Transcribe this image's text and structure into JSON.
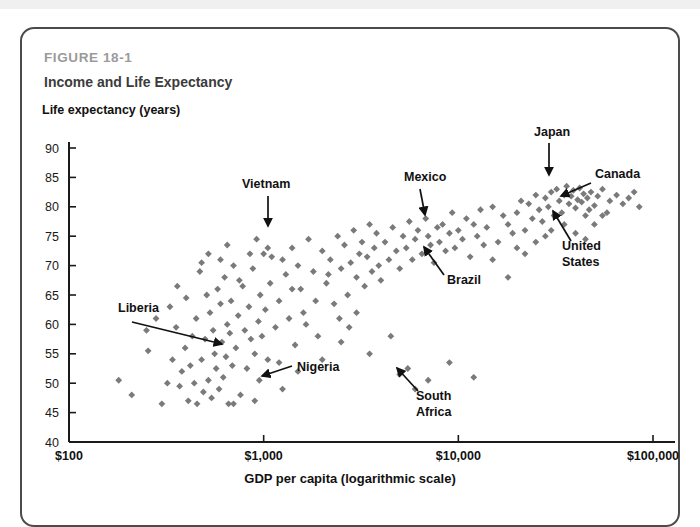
{
  "figure": {
    "number": "FIGURE 18-1",
    "title": "Income and Life Expectancy"
  },
  "axis_titles": {
    "y": "Life expectancy (years)",
    "x": "GDP per capita (logarithmic scale)"
  },
  "colors": {
    "marker": "#7a7a7a",
    "axis": "#1a1a1a",
    "figure_number": "#9a9a9a",
    "title": "#3b3b3b",
    "card_border": "#4b4b4b",
    "background": "#ffffff"
  },
  "chart_data": {
    "type": "scatter",
    "title": "Income and Life Expectancy",
    "subtitle": "FIGURE 18-1",
    "xlabel": "GDP per capita (logarithmic scale)",
    "ylabel": "Life expectancy (years)",
    "xscale": "log",
    "yscale": "linear",
    "xlim": [
      100,
      100000
    ],
    "ylim": [
      40,
      90
    ],
    "grid": false,
    "legend": null,
    "xticks": [
      100,
      1000,
      10000,
      100000
    ],
    "xticklabels": [
      "$100",
      "$1,000",
      "$10,000",
      "$100,000"
    ],
    "yticks": [
      40,
      45,
      50,
      55,
      60,
      65,
      70,
      75,
      80,
      85,
      90
    ],
    "yticklabels": [
      "40",
      "45",
      "50",
      "55",
      "60",
      "65",
      "70",
      "75",
      "80",
      "85",
      "90"
    ],
    "marker": "diamond",
    "marker_color": "#7a7a7a",
    "annotations": [
      {
        "label": "Liberia",
        "label_x": 118,
        "label_y": 312,
        "tip_x": 222,
        "tip_y": 344,
        "tail_x": 132,
        "tail_y": 322,
        "align": "start"
      },
      {
        "label": "Vietnam",
        "label_x": 242,
        "label_y": 188,
        "tip_x": 268,
        "tip_y": 226,
        "tail_x": 268,
        "tail_y": 196,
        "align": "start"
      },
      {
        "label": "Nigeria",
        "label_x": 297,
        "label_y": 371,
        "tip_x": 262,
        "tip_y": 376,
        "tail_x": 292,
        "tail_y": 366,
        "align": "start"
      },
      {
        "label": "Mexico",
        "label_x": 404,
        "label_y": 181,
        "tip_x": 425,
        "tip_y": 215,
        "tail_x": 420,
        "tail_y": 189,
        "align": "start"
      },
      {
        "label": "Brazil",
        "label_x": 447,
        "label_y": 284,
        "tip_x": 424,
        "tip_y": 247,
        "tail_x": 444,
        "tail_y": 275,
        "align": "start"
      },
      {
        "label": "Japan",
        "label_x": 534,
        "label_y": 136,
        "tip_x": 549,
        "tip_y": 175,
        "tail_x": 549,
        "tail_y": 143,
        "align": "start"
      },
      {
        "label": "Canada",
        "label_x": 595,
        "label_y": 178,
        "tip_x": 561,
        "tip_y": 196,
        "tail_x": 591,
        "tail_y": 183,
        "align": "start"
      },
      {
        "label": "United",
        "label_x": 562,
        "label_y": 250,
        "tip_x": 553,
        "tip_y": 211,
        "tail_x": 571,
        "tail_y": 241,
        "align": "start"
      },
      {
        "label": "States",
        "label_x": 562,
        "label_y": 266,
        "tip_x": null,
        "tip_y": null,
        "tail_x": null,
        "tail_y": null,
        "align": "start"
      },
      {
        "label": "South",
        "label_x": 416,
        "label_y": 400,
        "tip_x": 397,
        "tip_y": 368,
        "tail_x": 418,
        "tail_y": 391,
        "align": "start"
      },
      {
        "label": "Africa",
        "label_x": 416,
        "label_y": 416,
        "tip_x": null,
        "tip_y": null,
        "tail_x": null,
        "tail_y": null,
        "align": "start"
      }
    ],
    "points": [
      [
        180,
        50.5
      ],
      [
        210,
        48
      ],
      [
        255,
        55.5
      ],
      [
        300,
        46.5
      ],
      [
        330,
        63
      ],
      [
        355,
        59.5
      ],
      [
        360,
        66.5
      ],
      [
        370,
        49.5
      ],
      [
        380,
        52
      ],
      [
        395,
        56
      ],
      [
        400,
        64.5
      ],
      [
        410,
        47
      ],
      [
        420,
        53
      ],
      [
        430,
        58
      ],
      [
        440,
        50
      ],
      [
        450,
        61
      ],
      [
        455,
        46.5
      ],
      [
        470,
        69
      ],
      [
        480,
        54
      ],
      [
        490,
        48.5
      ],
      [
        500,
        57.5
      ],
      [
        510,
        65
      ],
      [
        520,
        50.5
      ],
      [
        530,
        62
      ],
      [
        540,
        47.5
      ],
      [
        550,
        59
      ],
      [
        560,
        55
      ],
      [
        570,
        52.5
      ],
      [
        580,
        66
      ],
      [
        590,
        49
      ],
      [
        600,
        63.5
      ],
      [
        610,
        57
      ],
      [
        620,
        51
      ],
      [
        630,
        68
      ],
      [
        640,
        54.5
      ],
      [
        650,
        60
      ],
      [
        660,
        46.5
      ],
      [
        670,
        58.5
      ],
      [
        680,
        64
      ],
      [
        690,
        53
      ],
      [
        700,
        70
      ],
      [
        720,
        56
      ],
      [
        740,
        61.5
      ],
      [
        760,
        48
      ],
      [
        780,
        66.5
      ],
      [
        800,
        59
      ],
      [
        820,
        52.5
      ],
      [
        840,
        63
      ],
      [
        860,
        57.5
      ],
      [
        880,
        69.5
      ],
      [
        900,
        55
      ],
      [
        920,
        74.5
      ],
      [
        940,
        60.5
      ],
      [
        950,
        50.5
      ],
      [
        960,
        65
      ],
      [
        980,
        58
      ],
      [
        1000,
        72
      ],
      [
        1020,
        62.5
      ],
      [
        1050,
        54
      ],
      [
        1080,
        67
      ],
      [
        1100,
        71.5
      ],
      [
        1150,
        59.5
      ],
      [
        1200,
        64
      ],
      [
        1250,
        49
      ],
      [
        1300,
        68.5
      ],
      [
        1350,
        61
      ],
      [
        1400,
        73
      ],
      [
        1450,
        56.5
      ],
      [
        1500,
        70
      ],
      [
        1550,
        66
      ],
      [
        1600,
        62
      ],
      [
        1700,
        74.5
      ],
      [
        1800,
        69
      ],
      [
        1900,
        58
      ],
      [
        2000,
        72.5
      ],
      [
        2100,
        67
      ],
      [
        2200,
        71
      ],
      [
        2300,
        63.5
      ],
      [
        2400,
        75
      ],
      [
        2500,
        69.5
      ],
      [
        2600,
        73.5
      ],
      [
        2700,
        65
      ],
      [
        2800,
        70.5
      ],
      [
        2900,
        76
      ],
      [
        3000,
        68
      ],
      [
        3100,
        72
      ],
      [
        3200,
        74
      ],
      [
        3300,
        66.5
      ],
      [
        3400,
        71.5
      ],
      [
        3500,
        77
      ],
      [
        3600,
        69
      ],
      [
        3700,
        73
      ],
      [
        3800,
        75.5
      ],
      [
        3900,
        70
      ],
      [
        4000,
        67.5
      ],
      [
        4200,
        74
      ],
      [
        4400,
        71
      ],
      [
        4600,
        76.5
      ],
      [
        4800,
        72.5
      ],
      [
        5000,
        69.5
      ],
      [
        5200,
        75
      ],
      [
        5400,
        73
      ],
      [
        5600,
        77.5
      ],
      [
        5800,
        71
      ],
      [
        6000,
        74.5
      ],
      [
        6200,
        76
      ],
      [
        6500,
        72
      ],
      [
        6800,
        78
      ],
      [
        7000,
        75
      ],
      [
        7200,
        73.5
      ],
      [
        7500,
        70.5
      ],
      [
        7800,
        76.5
      ],
      [
        8000,
        74
      ],
      [
        8300,
        77
      ],
      [
        8600,
        72.5
      ],
      [
        9000,
        75.5
      ],
      [
        9300,
        79
      ],
      [
        9600,
        73
      ],
      [
        10000,
        76
      ],
      [
        10500,
        74.5
      ],
      [
        11000,
        78
      ],
      [
        11500,
        71.5
      ],
      [
        12000,
        77
      ],
      [
        12500,
        75
      ],
      [
        13000,
        79.5
      ],
      [
        13500,
        73.5
      ],
      [
        14000,
        76.5
      ],
      [
        15000,
        80
      ],
      [
        16000,
        74
      ],
      [
        17000,
        78.5
      ],
      [
        18000,
        77
      ],
      [
        19000,
        75.5
      ],
      [
        20000,
        79
      ],
      [
        21000,
        81
      ],
      [
        22000,
        76
      ],
      [
        23000,
        80.5
      ],
      [
        24000,
        78
      ],
      [
        25000,
        82
      ],
      [
        26000,
        79.5
      ],
      [
        27000,
        77.5
      ],
      [
        28000,
        81.5
      ],
      [
        29000,
        80
      ],
      [
        30000,
        82.5
      ],
      [
        31000,
        78.5
      ],
      [
        32000,
        83
      ],
      [
        33000,
        81
      ],
      [
        34000,
        79
      ],
      [
        35000,
        82
      ],
      [
        36000,
        83.5
      ],
      [
        37000,
        80.5
      ],
      [
        38000,
        81.8
      ],
      [
        39000,
        82.8
      ],
      [
        40000,
        79.8
      ],
      [
        41000,
        81.2
      ],
      [
        42000,
        83.2
      ],
      [
        43000,
        80.8
      ],
      [
        44000,
        82.2
      ],
      [
        45000,
        78.5
      ],
      [
        46000,
        81.5
      ],
      [
        47000,
        79.5
      ],
      [
        48000,
        82.5
      ],
      [
        50000,
        80.2
      ],
      [
        52000,
        81.8
      ],
      [
        55000,
        83
      ],
      [
        58000,
        79
      ],
      [
        60000,
        81
      ],
      [
        65000,
        82
      ],
      [
        70000,
        80.5
      ],
      [
        75000,
        81.5
      ],
      [
        80000,
        82.5
      ],
      [
        85000,
        80
      ],
      [
        3000,
        62
      ],
      [
        3500,
        55
      ],
      [
        4500,
        58
      ],
      [
        5000,
        51.5
      ],
      [
        5500,
        52.5
      ],
      [
        6000,
        49
      ],
      [
        7000,
        50.5
      ],
      [
        9000,
        53.5
      ],
      [
        12000,
        51
      ],
      [
        2500,
        57
      ],
      [
        2000,
        54
      ],
      [
        1500,
        52
      ],
      [
        1200,
        53.5
      ],
      [
        900,
        47
      ],
      [
        700,
        46.5
      ],
      [
        250,
        59
      ],
      [
        280,
        61
      ],
      [
        320,
        50
      ],
      [
        340,
        54
      ],
      [
        480,
        70.5
      ],
      [
        520,
        72
      ],
      [
        600,
        71
      ],
      [
        650,
        73.5
      ],
      [
        750,
        67.5
      ],
      [
        850,
        72
      ],
      [
        1050,
        73
      ],
      [
        1250,
        71
      ],
      [
        1400,
        66
      ],
      [
        1650,
        60
      ],
      [
        1850,
        64
      ],
      [
        2150,
        68.5
      ],
      [
        2450,
        61
      ],
      [
        2750,
        59.5
      ],
      [
        15000,
        71
      ],
      [
        18000,
        68
      ],
      [
        25000,
        74
      ],
      [
        30000,
        76
      ],
      [
        35000,
        77
      ],
      [
        40000,
        75.5
      ],
      [
        45000,
        74.5
      ],
      [
        20000,
        73
      ],
      [
        22000,
        72
      ],
      [
        28000,
        75
      ],
      [
        50000,
        77
      ],
      [
        55000,
        78.5
      ]
    ]
  }
}
